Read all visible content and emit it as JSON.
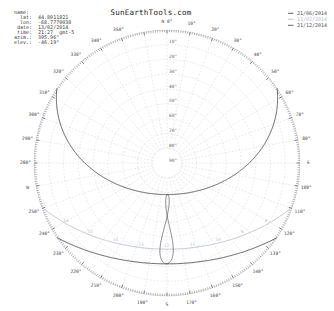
{
  "title": "SunEarthTools.com",
  "info_box": {
    "lines": [
      "name:",
      "  lat:  44.8011821",
      "  lon:  -68.7770038",
      " date:  13/02/2014",
      " time:  21:27  gmt-5",
      "azim.:  305.96°",
      "elev.:  -46.19°"
    ]
  },
  "legend": {
    "items": [
      {
        "label": "21/06/2014",
        "color": "#4f4f4f"
      },
      {
        "label": "13/02/2014",
        "color": "#b9c0ca"
      },
      {
        "label": "21/12/2014",
        "color": "#4f4f4f"
      }
    ]
  },
  "chart_data": {
    "type": "polar-sunpath",
    "latitude_deg": 44.8011821,
    "longitude_deg": -68.7770038,
    "azimuth_step_deg": 10,
    "azimuth_labels": [
      "N 0°",
      "10°",
      "20°",
      "30°",
      "40°",
      "50°",
      "60°",
      "70°",
      "80°",
      "E",
      "100°",
      "110°",
      "120°",
      "130°",
      "140°",
      "150°",
      "160°",
      "170°",
      "S",
      "190°",
      "200°",
      "210°",
      "220°",
      "230°",
      "240°",
      "250°",
      "W",
      "280°",
      "290°",
      "300°",
      "310°",
      "320°",
      "330°",
      "340°",
      "350°"
    ],
    "elevation_rings_deg": [
      10,
      20,
      30,
      40,
      50,
      60,
      70,
      80
    ],
    "elevation_labels": [
      "10°",
      "20°",
      "30°",
      "40°",
      "50°",
      "60°",
      "70°",
      "80°",
      "90°"
    ],
    "curves": [
      {
        "name": "21/06/2014",
        "declination_deg": 23.44,
        "color": "#4f4f4f",
        "width": 0.9
      },
      {
        "name": "13/02/2014",
        "declination_deg": -13.5,
        "color": "#b9c0ca",
        "width": 0.9
      },
      {
        "name": "21/12/2014",
        "declination_deg": -23.44,
        "color": "#4f4f4f",
        "width": 0.9
      }
    ],
    "hour_labels": {
      "hours": [
        8,
        9,
        10,
        11,
        12,
        13,
        14,
        15,
        16,
        17
      ],
      "curve_declination_deg": -13.5,
      "color": "#c2c8d0"
    },
    "analemma_noon": {
      "hour": 12,
      "color": "#4f4f4f",
      "width": 0.7
    },
    "grid_color": "#c9c9c9",
    "tick_color": "#5a5a5a",
    "azimuth_label_color": "#474747",
    "elevation_label_color": "#6a6a6a"
  }
}
